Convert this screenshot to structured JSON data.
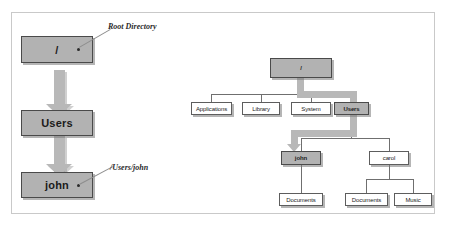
{
  "figure": {
    "colors": {
      "frame_border": "#c9c9c9",
      "node_border": "#5d5d5d",
      "node_fill": "#ffffff",
      "node_fill_shaded": "#b2b2b2",
      "edge": "#6f6f6f",
      "highlight_path": "#b8b8b8",
      "text": "#1b1b1b",
      "background": "#ffffff"
    }
  },
  "left_panel": {
    "name": "path-drilldown",
    "nodes": [
      {
        "id": "root",
        "label": "/",
        "shaded": true,
        "has_dot": true
      },
      {
        "id": "users",
        "label": "Users",
        "shaded": true,
        "has_dot": false
      },
      {
        "id": "john",
        "label": "john",
        "shaded": true,
        "has_dot": true
      }
    ],
    "annotations": [
      {
        "id": "root-callout",
        "text": "Root Directory",
        "target": "root"
      },
      {
        "id": "john-callout",
        "text": "/Users/john",
        "target": "john"
      }
    ],
    "arrows": [
      {
        "from": "root",
        "to": "users",
        "style": "thick-gray-down"
      },
      {
        "from": "users",
        "to": "john",
        "style": "thick-gray-down"
      }
    ]
  },
  "right_panel": {
    "name": "filesystem-tree",
    "nodes": [
      {
        "id": "r-root",
        "label": "/",
        "level": 0,
        "shaded": true
      },
      {
        "id": "r-applications",
        "label": "Applications",
        "level": 1,
        "shaded": false
      },
      {
        "id": "r-library",
        "label": "Library",
        "level": 1,
        "shaded": false
      },
      {
        "id": "r-system",
        "label": "System",
        "level": 1,
        "shaded": false
      },
      {
        "id": "r-users",
        "label": "Users",
        "level": 1,
        "shaded": true
      },
      {
        "id": "r-john",
        "label": "john",
        "level": 2,
        "shaded": true
      },
      {
        "id": "r-carol",
        "label": "carol",
        "level": 2,
        "shaded": false
      },
      {
        "id": "r-john-docs",
        "label": "Documents",
        "level": 3,
        "shaded": false
      },
      {
        "id": "r-carol-docs",
        "label": "Documents",
        "level": 3,
        "shaded": false
      },
      {
        "id": "r-carol-music",
        "label": "Music",
        "level": 3,
        "shaded": false
      }
    ],
    "edges": [
      {
        "from": "r-root",
        "to": "r-applications"
      },
      {
        "from": "r-root",
        "to": "r-library"
      },
      {
        "from": "r-root",
        "to": "r-system"
      },
      {
        "from": "r-root",
        "to": "r-users"
      },
      {
        "from": "r-users",
        "to": "r-john"
      },
      {
        "from": "r-users",
        "to": "r-carol"
      },
      {
        "from": "r-john",
        "to": "r-john-docs"
      },
      {
        "from": "r-carol",
        "to": "r-carol-docs"
      },
      {
        "from": "r-carol",
        "to": "r-carol-music"
      }
    ],
    "highlighted_path": [
      "r-root",
      "r-users",
      "r-john"
    ]
  }
}
